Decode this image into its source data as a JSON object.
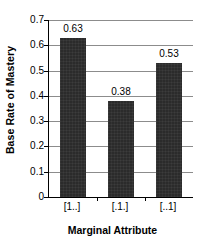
{
  "chart_data": {
    "type": "bar",
    "title": "",
    "xlabel": "Marginal Attribute",
    "ylabel": "Base Rate of Mastery",
    "categories": [
      "[1..]",
      "[.1.]",
      "[..1]"
    ],
    "values": [
      0.63,
      0.38,
      0.53
    ],
    "value_labels": [
      "0.63",
      "0.38",
      "0.53"
    ],
    "ylim": [
      0,
      0.7
    ],
    "ytick_values": [
      0,
      0.1,
      0.2,
      0.3,
      0.4,
      0.5,
      0.6,
      0.7
    ],
    "ytick_labels": [
      "0",
      "0.1",
      "0.2",
      "0.3",
      "0.4",
      "0.5",
      "0.6",
      "0.7"
    ],
    "grid": "horizontal",
    "legend": "none",
    "bar_color": "#2b2b2b",
    "gridline_color": "#8c8c8c",
    "axis_color": "#000000"
  }
}
